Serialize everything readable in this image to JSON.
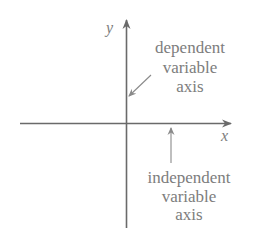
{
  "diagram": {
    "axes": {
      "y_label": "y",
      "x_label": "x"
    },
    "annotations": {
      "dependent": [
        "dependent",
        "variable",
        "axis"
      ],
      "independent": [
        "independent",
        "variable",
        "axis"
      ]
    },
    "colors": {
      "axis": "#6a6a6a",
      "text": "#7d7d7d",
      "pointer": "#8a8a8a"
    }
  }
}
